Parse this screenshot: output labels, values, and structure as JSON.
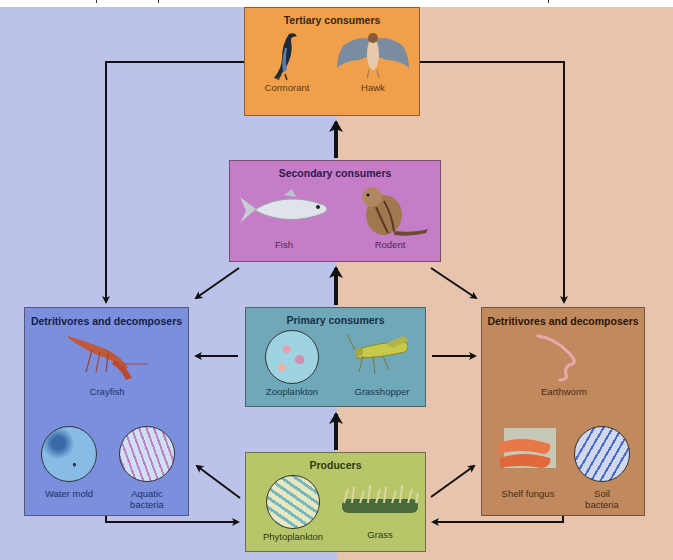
{
  "diagram": {
    "type": "food-web",
    "background": {
      "left_color": "#bcc3ea",
      "right_color": "#e8c3ae",
      "left_meaning": "aquatic",
      "right_meaning": "terrestrial"
    }
  },
  "boxes": {
    "tertiary": {
      "title": "Tertiary consumers",
      "color": "#f0a04a",
      "title_color": "#3a2412",
      "organisms": [
        {
          "label": "Cormorant",
          "icon": "cormorant-icon"
        },
        {
          "label": "Hawk",
          "icon": "hawk-icon"
        }
      ]
    },
    "secondary": {
      "title": "Secondary consumers",
      "color": "#c57dc8",
      "title_color": "#2e1a46",
      "organisms": [
        {
          "label": "Fish",
          "icon": "fish-icon"
        },
        {
          "label": "Rodent",
          "icon": "rodent-icon"
        }
      ]
    },
    "primary": {
      "title": "Primary consumers",
      "color": "#6fa8b8",
      "title_color": "#16304a",
      "organisms": [
        {
          "label": "Zooplankton",
          "icon": "zooplankton-icon"
        },
        {
          "label": "Grasshopper",
          "icon": "grasshopper-icon"
        }
      ]
    },
    "producers": {
      "title": "Producers",
      "color": "#b8c66a",
      "title_color": "#2e3a12",
      "organisms": [
        {
          "label": "Phytoplankton",
          "icon": "phytoplankton-icon"
        },
        {
          "label": "Grass",
          "icon": "grass-icon"
        }
      ]
    },
    "detritivores_aquatic": {
      "title": "Detritivores and decomposers",
      "color": "#7b8fdd",
      "title_color": "#14204a",
      "organisms": [
        {
          "label": "Crayfish",
          "icon": "crayfish-icon"
        },
        {
          "label": "Water mold",
          "icon": "water-mold-icon"
        },
        {
          "label": "Aquatic bacteria",
          "label_line1": "Aquatic",
          "label_line2": "bacteria",
          "icon": "aquatic-bacteria-icon"
        }
      ]
    },
    "detritivores_terrestrial": {
      "title": "Detritivores and decomposers",
      "color": "#c08a5e",
      "title_color": "#2a160a",
      "organisms": [
        {
          "label": "Earthworm",
          "icon": "earthworm-icon"
        },
        {
          "label": "Shelf fungus",
          "icon": "shelf-fungus-icon"
        },
        {
          "label": "Soil bacteria",
          "label_line1": "Soil",
          "label_line2": "bacteria",
          "icon": "soil-bacteria-icon"
        }
      ]
    }
  },
  "arrows": [
    {
      "from": "Secondary consumers",
      "to": "Tertiary consumers"
    },
    {
      "from": "Primary consumers",
      "to": "Secondary consumers"
    },
    {
      "from": "Producers",
      "to": "Primary consumers"
    },
    {
      "from": "Tertiary consumers",
      "to": "Detritivores and decomposers (aquatic)"
    },
    {
      "from": "Tertiary consumers",
      "to": "Detritivores and decomposers (terrestrial)"
    },
    {
      "from": "Secondary consumers",
      "to": "Detritivores and decomposers (aquatic)"
    },
    {
      "from": "Secondary consumers",
      "to": "Detritivores and decomposers (terrestrial)"
    },
    {
      "from": "Primary consumers",
      "to": "Detritivores and decomposers (aquatic)"
    },
    {
      "from": "Primary consumers",
      "to": "Detritivores and decomposers (terrestrial)"
    },
    {
      "from": "Producers",
      "to": "Detritivores and decomposers (aquatic)"
    },
    {
      "from": "Producers",
      "to": "Detritivores and decomposers (terrestrial)"
    },
    {
      "from": "Detritivores and decomposers (aquatic)",
      "to": "Producers"
    },
    {
      "from": "Detritivores and decomposers (terrestrial)",
      "to": "Producers"
    }
  ]
}
